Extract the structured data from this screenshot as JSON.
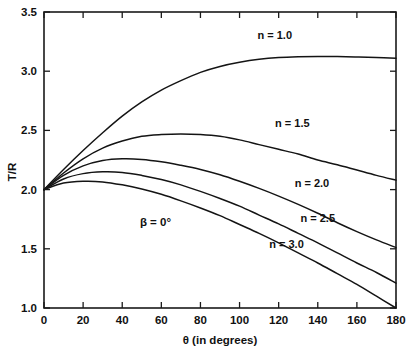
{
  "chart_data": {
    "type": "line",
    "title": "",
    "xlabel": "θ (in degrees)",
    "ylabel": "T/R",
    "xlim": [
      0,
      180
    ],
    "ylim": [
      1.0,
      3.5
    ],
    "xticks": [
      0,
      20,
      40,
      60,
      80,
      100,
      120,
      140,
      160,
      180
    ],
    "xticklabels": [
      "0",
      "20",
      "40",
      "60",
      "80",
      "100",
      "120",
      "140",
      "160",
      "180"
    ],
    "yticks": [
      1.0,
      1.5,
      2.0,
      2.5,
      3.0,
      3.5
    ],
    "yticklabels": [
      "1.0",
      "1.5",
      "2.0",
      "2.5",
      "3.0",
      "3.5"
    ],
    "grid": false,
    "legend": "inline-curve-labels",
    "line_color": "#141414",
    "frame_color": "#1a1a1a",
    "background": "#ffffff",
    "annotations": [
      {
        "text": "β = 0°",
        "x": 57,
        "y": 1.69
      }
    ],
    "x": [
      0,
      10,
      20,
      30,
      40,
      50,
      60,
      70,
      80,
      90,
      100,
      110,
      120,
      130,
      140,
      150,
      160,
      170,
      180
    ],
    "series": [
      {
        "name": "n = 1.0",
        "label": "n = 1.0",
        "label_x": 118,
        "label_y": 3.27,
        "values": [
          2.0,
          2.17,
          2.33,
          2.48,
          2.62,
          2.74,
          2.84,
          2.92,
          2.99,
          3.04,
          3.075,
          3.1,
          3.115,
          3.122,
          3.125,
          3.124,
          3.12,
          3.115,
          3.11
        ]
      },
      {
        "name": "n = 1.5",
        "label": "n = 1.5",
        "label_x": 127,
        "label_y": 2.53,
        "values": [
          2.0,
          2.14,
          2.26,
          2.35,
          2.41,
          2.45,
          2.465,
          2.47,
          2.465,
          2.45,
          2.42,
          2.38,
          2.34,
          2.3,
          2.25,
          2.21,
          2.165,
          2.12,
          2.08
        ]
      },
      {
        "name": "n = 2.0",
        "label": "n = 2.0",
        "label_x": 137,
        "label_y": 2.02,
        "values": [
          2.0,
          2.12,
          2.2,
          2.245,
          2.26,
          2.255,
          2.235,
          2.205,
          2.17,
          2.125,
          2.07,
          2.01,
          1.945,
          1.875,
          1.8,
          1.72,
          1.645,
          1.575,
          1.51
        ]
      },
      {
        "name": "n = 2.5",
        "label": "n = 2.5",
        "label_x": 140,
        "label_y": 1.73,
        "values": [
          2.0,
          2.09,
          2.135,
          2.15,
          2.145,
          2.12,
          2.085,
          2.04,
          1.985,
          1.925,
          1.86,
          1.785,
          1.71,
          1.63,
          1.55,
          1.465,
          1.38,
          1.3,
          1.21
        ]
      },
      {
        "name": "n = 3.0",
        "label": "n = 3.0",
        "label_x": 124,
        "label_y": 1.51,
        "values": [
          2.0,
          2.055,
          2.07,
          2.065,
          2.04,
          2.005,
          1.96,
          1.905,
          1.845,
          1.78,
          1.705,
          1.63,
          1.55,
          1.465,
          1.38,
          1.29,
          1.2,
          1.1,
          1.0
        ]
      }
    ]
  }
}
